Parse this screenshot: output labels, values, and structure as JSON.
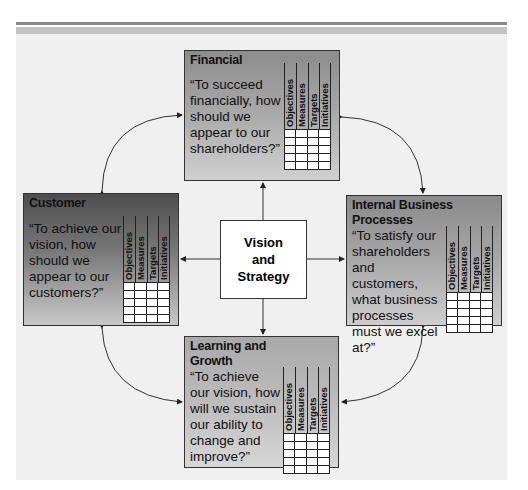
{
  "diagram": {
    "type": "balanced-scorecard",
    "center": {
      "label_lines": [
        "Vision",
        "and",
        "Strategy"
      ]
    },
    "grid_columns": [
      "Objectives",
      "Measures",
      "Targets",
      "Initiatives"
    ],
    "grid_rows": 5,
    "perspectives": {
      "financial": {
        "title": "Financial",
        "question": "“To succeed financially, how should we appear to our shareholders?”"
      },
      "customer": {
        "title": "Customer",
        "question": "“To achieve our vision, how should we appear to our customers?”"
      },
      "internal": {
        "title": "Internal Business Processes",
        "question": "“To satisfy our shareholders and customers, what business processes must we excel at?”"
      },
      "learning": {
        "title": "Learning and Growth",
        "question": "“To achieve our vision, how will we sustain our ability to change and improve?”"
      }
    },
    "colors": {
      "panel_bg": "#f0f0f0",
      "rule_dark": "#8a8a8a",
      "rule_light": "#c4c4c4",
      "line": "#333333"
    }
  }
}
